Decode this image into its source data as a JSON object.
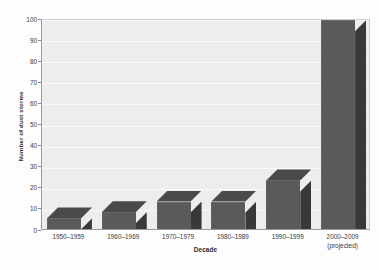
{
  "chart_data": {
    "type": "bar",
    "title": "",
    "xlabel": "Decade",
    "ylabel": "Number of dust storms",
    "categories": [
      "1950–1959",
      "1960–1969",
      "1970–1979",
      "1980–1989",
      "1990–1999",
      "2000–2009"
    ],
    "category_sublabels": [
      "",
      "",
      "",
      "",
      "",
      "(projected)"
    ],
    "values": [
      5,
      8,
      13,
      13,
      23,
      99
    ],
    "ylim": [
      0,
      100
    ],
    "yticks": [
      0,
      10,
      20,
      30,
      40,
      50,
      60,
      70,
      80,
      90,
      100
    ],
    "ytick_labels": [
      "0",
      "10",
      "20",
      "30",
      "40",
      "50",
      "60",
      "70",
      "80",
      "90",
      "100"
    ],
    "grid": true,
    "legend": "none",
    "style": "3d-bar",
    "colors": {
      "bar_front": "#5a5a5c",
      "bar_side": "#39393b",
      "bar_top": "#4a4a4c",
      "plot_background": "#ededee",
      "gridline": "#fafafa",
      "axis": "#9a9a9a",
      "text": "#3a3a3a",
      "page_background": "#fdfdfd"
    }
  }
}
